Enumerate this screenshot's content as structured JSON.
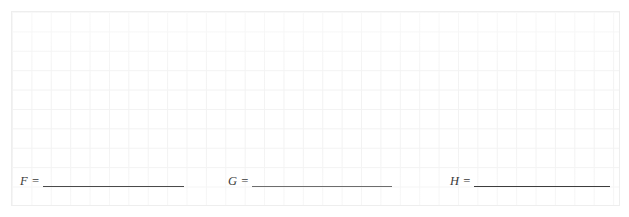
{
  "worksheet": {
    "box": {
      "name": "answer-box",
      "border_color": "#eeeeee",
      "grid_color": "#f2f2f2",
      "background_color": "#ffffff",
      "grid_cell_px": "19.4"
    },
    "fields": [
      {
        "id": "f",
        "label": "F =",
        "variable": "F",
        "value": "",
        "placeholder": "",
        "blank_color": "#4a4a4a"
      },
      {
        "id": "g",
        "label": "G =",
        "variable": "G",
        "value": "",
        "placeholder": "",
        "blank_color": "#6d6d6d"
      },
      {
        "id": "h",
        "label": "H =",
        "variable": "H",
        "value": "",
        "placeholder": "",
        "blank_color": "#3d3d3d"
      }
    ]
  }
}
